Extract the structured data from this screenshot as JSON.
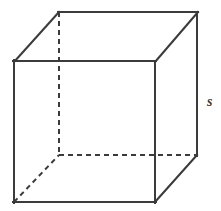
{
  "figure": {
    "name": "cube-diagram",
    "shape": "cube",
    "projection": "oblique",
    "background_color": "#ffffff",
    "line_color": "#3b3b3b",
    "labels": {
      "side_length": "s"
    },
    "geometry": {
      "front_face": {
        "top_left": [
          14,
          61
        ],
        "top_right": [
          155,
          61
        ],
        "bottom_right": [
          155,
          202
        ],
        "bottom_left": [
          14,
          202
        ]
      },
      "back_face": {
        "top_left": [
          59,
          12
        ],
        "top_right": [
          198,
          12
        ],
        "bottom_right": [
          197,
          155
        ],
        "bottom_left": [
          59,
          155
        ]
      },
      "hidden_edges": [
        {
          "name": "back-vertical-left",
          "from": [
            59,
            12
          ],
          "to": [
            59,
            155
          ]
        },
        {
          "name": "back-bottom-horizontal",
          "from": [
            59,
            155
          ],
          "to": [
            197,
            155
          ]
        },
        {
          "name": "bottom-left-depth",
          "from": [
            14,
            202
          ],
          "to": [
            59,
            155
          ]
        }
      ],
      "visible_edges": [
        {
          "name": "front-top",
          "from": [
            14,
            61
          ],
          "to": [
            155,
            61
          ]
        },
        {
          "name": "front-right",
          "from": [
            155,
            61
          ],
          "to": [
            155,
            202
          ]
        },
        {
          "name": "front-bottom",
          "from": [
            14,
            202
          ],
          "to": [
            155,
            202
          ]
        },
        {
          "name": "front-left",
          "from": [
            14,
            61
          ],
          "to": [
            14,
            202
          ]
        },
        {
          "name": "back-top",
          "from": [
            59,
            12
          ],
          "to": [
            198,
            12
          ]
        },
        {
          "name": "back-right-vertical",
          "from": [
            197,
            12
          ],
          "to": [
            197,
            155
          ]
        },
        {
          "name": "top-left-depth",
          "from": [
            14,
            61
          ],
          "to": [
            59,
            12
          ]
        },
        {
          "name": "top-right-depth",
          "from": [
            155,
            61
          ],
          "to": [
            198,
            12
          ]
        },
        {
          "name": "bottom-right-depth",
          "from": [
            155,
            202
          ],
          "to": [
            197,
            155
          ]
        }
      ]
    },
    "label_position": {
      "side_length": [
        207,
        95
      ]
    }
  }
}
